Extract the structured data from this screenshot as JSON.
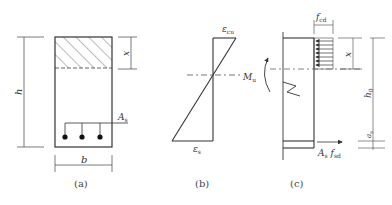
{
  "figure": {
    "panels": [
      {
        "id": "a",
        "caption": "(a)",
        "title": "cross-section",
        "labels": {
          "height": "h",
          "compression_depth": "x",
          "width": "b",
          "steel_area": "A",
          "steel_area_sub": "s"
        }
      },
      {
        "id": "b",
        "caption": "(b)",
        "title": "strain distribution",
        "labels": {
          "top_strain": "ε",
          "top_strain_sub": "cu",
          "bottom_strain": "ε",
          "bottom_strain_sub": "s"
        }
      },
      {
        "id": "c",
        "caption": "(c)",
        "title": "stress/force distribution",
        "labels": {
          "concrete_stress": "f",
          "concrete_stress_sub": "cd",
          "compression_depth": "x",
          "moment": "M",
          "moment_sub": "u",
          "effective_depth": "h",
          "effective_depth_sub": "0",
          "cover": "a",
          "cover_sub": "s",
          "steel_force_A": "A",
          "steel_force_A_sub": "s",
          "steel_force_f": "f",
          "steel_force_f_sub": "sd"
        }
      }
    ],
    "colors": {
      "line": "#333333",
      "dash": "#666666",
      "background": "#ffffff"
    }
  }
}
